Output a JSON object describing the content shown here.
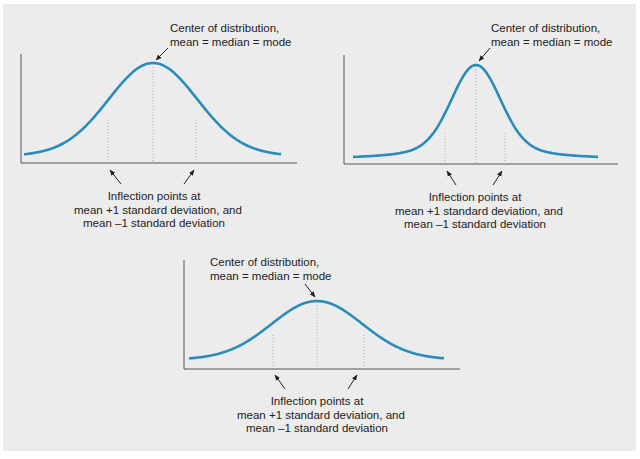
{
  "figure": {
    "background": "#ececec",
    "curve_color": "#2a8cbb",
    "axis_color": "#555555",
    "text_color": "#222222"
  },
  "labels": {
    "center_line1": "Center of distribution,",
    "center_line2": "mean = median = mode",
    "inflection_line1": "Inflection points at",
    "inflection_line2": "mean +1 standard deviation, and",
    "inflection_line3": "mean –1 standard deviation"
  },
  "chart_data": [
    {
      "type": "line",
      "name": "normal-distribution-standard",
      "title": "",
      "description": "Symmetric bell curve; center at mean = median = mode; dotted guides at mean and ±1 standard deviation",
      "axes": {
        "x0": 21,
        "y0": 163,
        "x1": 297,
        "ytop": 54
      },
      "curve": {
        "xstart": 24,
        "xend": 281,
        "mean_x": 153,
        "peak_y": 63,
        "base_y": 158,
        "sd_px": 44,
        "shape": "gaussian"
      },
      "inflection_x": [
        108,
        196
      ],
      "annotations": [
        "Center of distribution, mean = median = mode",
        "Inflection points at mean +1 standard deviation, and mean –1 standard deviation"
      ]
    },
    {
      "type": "line",
      "name": "normal-distribution-narrow",
      "title": "",
      "description": "Tall narrow peaked curve with heavy tails; center at mean = median = mode",
      "axes": {
        "x0": 344,
        "y0": 164,
        "x1": 618,
        "ytop": 55
      },
      "curve": {
        "xstart": 353,
        "xend": 598,
        "mean_x": 476,
        "peak_y": 65,
        "base_y": 160,
        "sd_px": 30,
        "shape": "peaked"
      },
      "inflection_x": [
        445,
        505
      ],
      "annotations": [
        "Center of distribution, mean = median = mode",
        "Inflection points at mean +1 standard deviation, and mean –1 standard deviation"
      ]
    },
    {
      "type": "line",
      "name": "normal-distribution-flat",
      "title": "",
      "description": "Lower, wider bell curve; center at mean = median = mode",
      "axes": {
        "x0": 184,
        "y0": 369,
        "x1": 460,
        "ytop": 260
      },
      "curve": {
        "xstart": 189,
        "xend": 444,
        "mean_x": 317,
        "peak_y": 301,
        "base_y": 361,
        "sd_px": 45,
        "shape": "gaussian"
      },
      "inflection_x": [
        273,
        364
      ],
      "annotations": [
        "Center of distribution, mean = median = mode",
        "Inflection points at mean +1 standard deviation, and mean –1 standard deviation"
      ]
    }
  ]
}
